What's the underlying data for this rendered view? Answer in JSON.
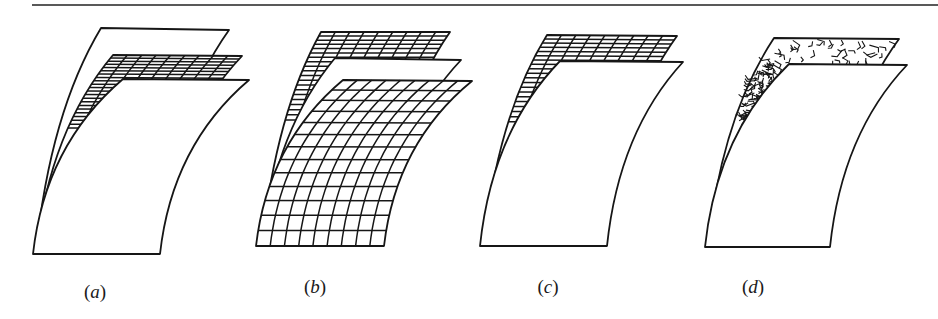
{
  "figure": {
    "top_rule": {
      "x1": 32,
      "x2": 938,
      "y": 5
    },
    "stroke_color": "#161616",
    "background": "#ffffff",
    "panels": [
      {
        "id": "a",
        "label": "(a)",
        "description": "Three stacked curved sheets: plain back sheet, gridded middle sheet (only top rows visible), plain front sheet",
        "layers": [
          "plain",
          "grid",
          "plain"
        ],
        "label_pos": [
          95,
          295
        ]
      },
      {
        "id": "b",
        "label": "(b)",
        "description": "Three stacked curved sheets: gridded back sheet, plain middle sheet, fully gridded front sheet",
        "layers": [
          "grid",
          "plain",
          "grid"
        ],
        "label_pos": [
          315,
          290
        ]
      },
      {
        "id": "c",
        "label": "(c)",
        "description": "Two stacked curved sheets: gridded back sheet, plain front sheet",
        "layers": [
          "grid",
          "plain"
        ],
        "label_pos": [
          548,
          290
        ]
      },
      {
        "id": "d",
        "label": "(d)",
        "description": "Two stacked curved sheets: random-fiber (chopped strand) back sheet, plain front sheet",
        "layers": [
          "random-fiber",
          "plain"
        ],
        "label_pos": [
          753,
          290
        ]
      }
    ]
  },
  "labels": {
    "a": "a",
    "b": "b",
    "c": "c",
    "d": "d"
  }
}
